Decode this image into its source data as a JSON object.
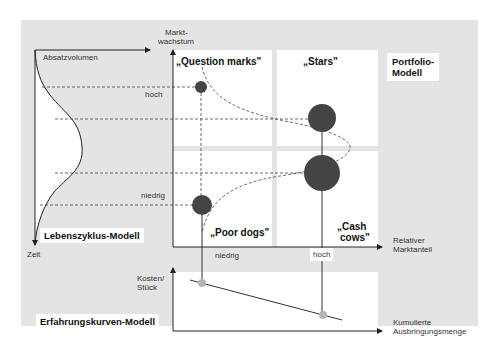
{
  "models": {
    "lifecycle": {
      "title": "Lebenszyklus-Modell",
      "y_axis_label": "Absatzvolumen",
      "x_axis_label": "Zeit"
    },
    "portfolio": {
      "title_line1": "Portfolio-",
      "title_line2": "Modell",
      "y_axis_label_line1": "Markt-",
      "y_axis_label_line2": "wachstum",
      "x_axis_label_line1": "Relativer",
      "x_axis_label_line2": "Marktanteil",
      "y_ticks": {
        "high": "hoch",
        "low": "niedrig"
      },
      "x_ticks": {
        "low": "niedrig",
        "high": "hoch"
      },
      "quadrants": {
        "question_marks": "„Question marks\"",
        "stars": "„Stars\"",
        "poor_dogs": "„Poor dogs\"",
        "cash_cows_line1": "„Cash",
        "cash_cows_line2": "cows\""
      }
    },
    "experience_curve": {
      "title": "Erfahrungskurven-Modell",
      "y_axis_label_line1": "Kosten/",
      "y_axis_label_line2": "Stück",
      "x_axis_label_line1": "Kumulierte",
      "x_axis_label_line2": "Ausbringungsmenge"
    }
  },
  "colors": {
    "panel_bg": "#e4e4e4",
    "plot_bg": "#ffffff",
    "circle_fill": "#444444",
    "marker_fill": "#b5b5b5",
    "line": "#333333"
  }
}
